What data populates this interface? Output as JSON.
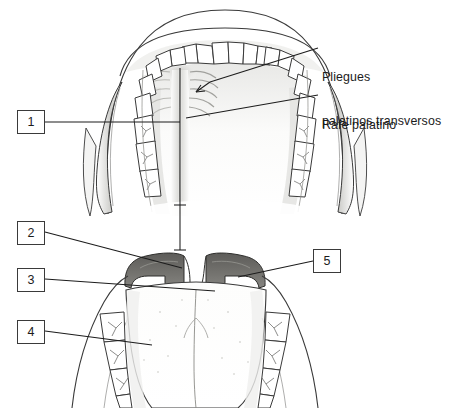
{
  "figure": {
    "background_color": "#ffffff",
    "line_color": "#3a3a3a",
    "ink_color": "#1c1c1c",
    "mucosa_dark_color": "#6d6c69",
    "mucosa_mid_color": "#9b9a96",
    "shade_light_color": "#d9d9d6"
  },
  "text_labels": [
    {
      "id": "pliegues-palatinos-transversos",
      "line1": "Pliegues",
      "line2": "palatinos transversos",
      "x": 322,
      "y": 41
    },
    {
      "id": "rafe-palatino",
      "line1": "Rafe palatino",
      "line2": "",
      "x": 322,
      "y": 89
    }
  ],
  "callouts": [
    {
      "id": "callout-1",
      "number": "1",
      "x": 17,
      "y": 110
    },
    {
      "id": "callout-2",
      "number": "2",
      "x": 17,
      "y": 221
    },
    {
      "id": "callout-3",
      "number": "3",
      "x": 17,
      "y": 268
    },
    {
      "id": "callout-4",
      "number": "4",
      "x": 17,
      "y": 320
    },
    {
      "id": "callout-5",
      "number": "5",
      "x": 313,
      "y": 249
    }
  ]
}
